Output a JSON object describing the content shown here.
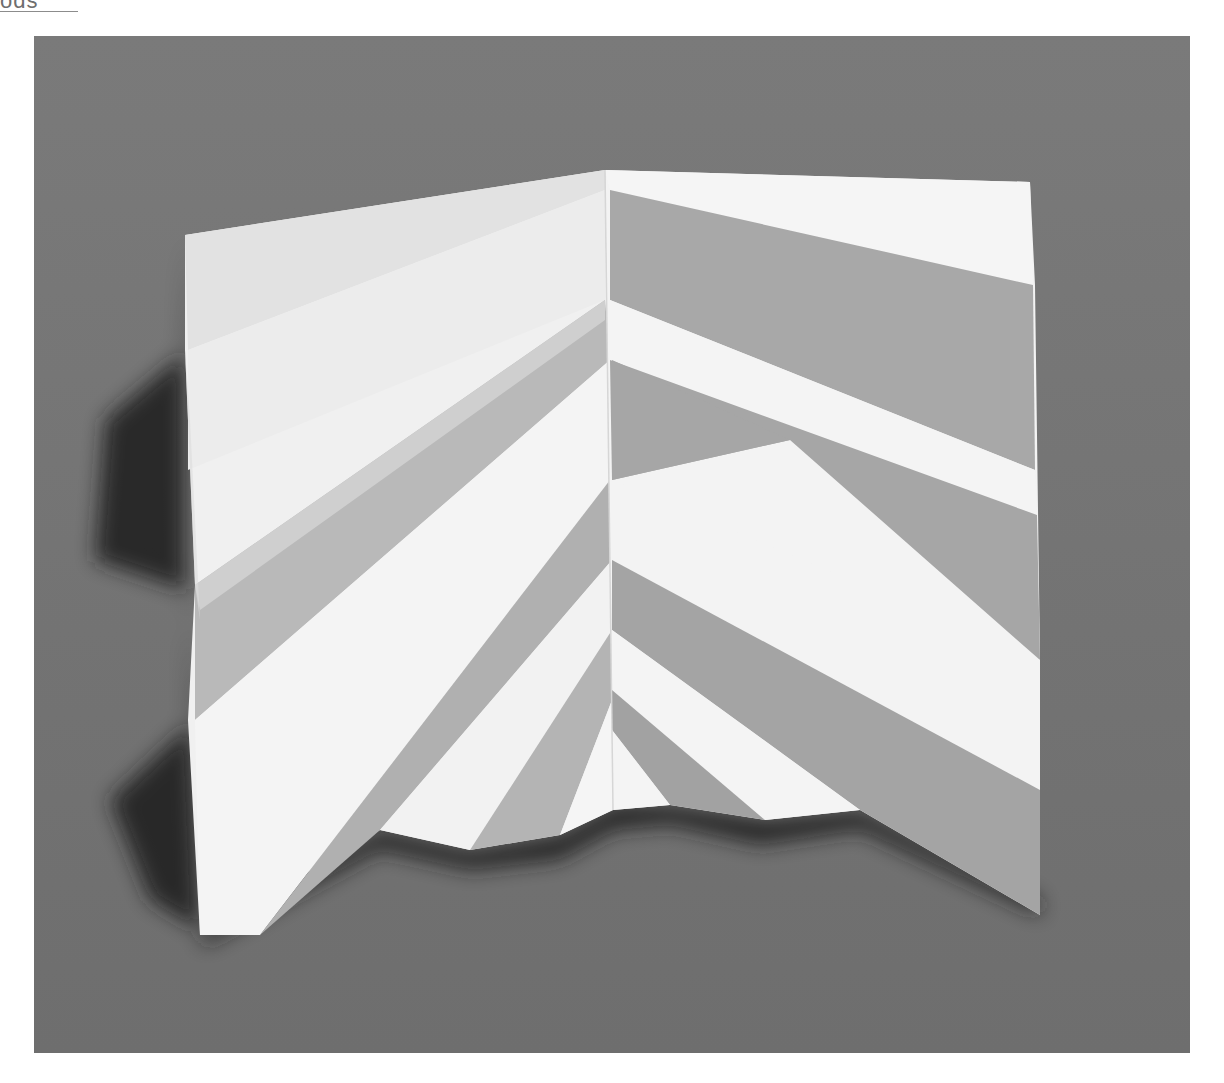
{
  "page": {
    "running_head": "ods",
    "photo": {
      "subject": "folded-paper-pleat-sculpture",
      "background_color": "#7b7b7b",
      "paper_light": "#f4f4f4",
      "paper_mid": "#c9c9c9",
      "paper_shadow": "#9a9a9a",
      "cast_shadow": "#2a2a2a"
    }
  }
}
